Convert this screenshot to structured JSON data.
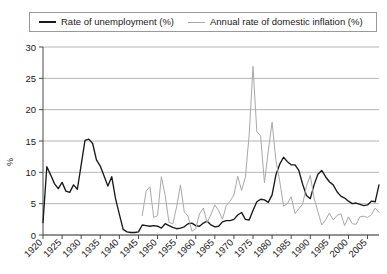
{
  "legend": {
    "position": "top",
    "entries": [
      {
        "label": "Rate of unemployment (%)",
        "color": "#1a1a1a"
      },
      {
        "label": "Annual rate of domestic inflation (%)",
        "color": "#a9a9a9"
      }
    ]
  },
  "chart_data": {
    "type": "line",
    "title": "",
    "xlabel": "",
    "ylabel": "%",
    "xlim": [
      1920,
      2008
    ],
    "ylim": [
      0,
      30
    ],
    "grid": true,
    "legend_position": "top",
    "yticks": [
      0,
      5,
      10,
      15,
      20,
      25,
      30
    ],
    "ytick_labels": [
      "0",
      "5",
      "10",
      "15",
      "20",
      "25",
      "30"
    ],
    "xticks": [
      1920,
      1925,
      1930,
      1935,
      1940,
      1945,
      1950,
      1955,
      1960,
      1965,
      1970,
      1975,
      1980,
      1985,
      1990,
      1995,
      2000,
      2005
    ],
    "xtick_labels": [
      "1920",
      "1925",
      "1930",
      "1935",
      "1940",
      "1945",
      "1950",
      "1955",
      "1960",
      "1965",
      "1970",
      "1975",
      "1980",
      "1985",
      "1990",
      "1995",
      "2000",
      "2005"
    ],
    "x": [
      1920,
      1921,
      1922,
      1923,
      1924,
      1925,
      1926,
      1927,
      1928,
      1929,
      1930,
      1931,
      1932,
      1933,
      1934,
      1935,
      1936,
      1937,
      1938,
      1939,
      1940,
      1941,
      1942,
      1943,
      1944,
      1945,
      1946,
      1947,
      1948,
      1949,
      1950,
      1951,
      1952,
      1953,
      1954,
      1955,
      1956,
      1957,
      1958,
      1959,
      1960,
      1961,
      1962,
      1963,
      1964,
      1965,
      1966,
      1967,
      1968,
      1969,
      1970,
      1971,
      1972,
      1973,
      1974,
      1975,
      1976,
      1977,
      1978,
      1979,
      1980,
      1981,
      1982,
      1983,
      1984,
      1985,
      1986,
      1987,
      1988,
      1989,
      1990,
      1991,
      1992,
      1993,
      1994,
      1995,
      1996,
      1997,
      1998,
      1999,
      2000,
      2001,
      2002,
      2003,
      2004,
      2005,
      2006,
      2007,
      2008
    ],
    "series": [
      {
        "name": "Rate of unemployment (%)",
        "color": "#1a1a1a",
        "values": [
          2.0,
          10.9,
          9.6,
          8.2,
          7.4,
          8.4,
          7.0,
          6.8,
          8.0,
          7.3,
          11.2,
          15.1,
          15.3,
          14.6,
          12.0,
          11.0,
          9.4,
          7.8,
          9.3,
          5.8,
          3.3,
          0.9,
          0.5,
          0.4,
          0.4,
          0.5,
          1.6,
          1.5,
          1.4,
          1.5,
          1.4,
          1.1,
          1.8,
          1.5,
          1.2,
          1.0,
          1.1,
          1.3,
          1.8,
          1.9,
          1.5,
          1.4,
          1.9,
          2.2,
          1.6,
          1.3,
          1.4,
          2.1,
          2.3,
          2.3,
          2.5,
          3.2,
          3.6,
          2.5,
          2.4,
          3.9,
          5.3,
          5.7,
          5.6,
          5.2,
          6.4,
          9.6,
          11.3,
          12.4,
          11.7,
          11.2,
          11.2,
          10.3,
          8.1,
          6.3,
          5.8,
          8.0,
          9.7,
          10.3,
          9.3,
          8.5,
          8.0,
          6.9,
          6.2,
          5.9,
          5.4,
          5.0,
          5.1,
          4.9,
          4.7,
          4.8,
          5.4,
          5.3,
          8.0
        ]
      },
      {
        "name": "Annual rate of domestic inflation (%)",
        "color": "#a9a9a9",
        "values": [
          null,
          null,
          null,
          null,
          null,
          null,
          null,
          null,
          null,
          null,
          null,
          null,
          null,
          null,
          null,
          null,
          null,
          null,
          null,
          null,
          null,
          null,
          null,
          null,
          null,
          null,
          3.1,
          7.0,
          7.7,
          2.8,
          3.1,
          9.3,
          6.3,
          2.0,
          1.8,
          4.5,
          8.0,
          3.7,
          3.0,
          0.6,
          1.0,
          3.4,
          4.3,
          2.0,
          3.3,
          4.8,
          3.9,
          2.5,
          4.7,
          5.4,
          6.4,
          9.4,
          7.1,
          9.2,
          16.0,
          26.9,
          16.5,
          15.8,
          8.3,
          13.4,
          18.0,
          11.9,
          8.6,
          4.6,
          5.0,
          6.1,
          3.4,
          4.2,
          4.9,
          7.8,
          9.5,
          5.9,
          3.7,
          1.6,
          2.4,
          3.5,
          2.4,
          3.1,
          3.4,
          1.5,
          2.9,
          1.8,
          1.7,
          2.9,
          3.0,
          2.8,
          3.2,
          4.3,
          3.6
        ]
      }
    ]
  }
}
